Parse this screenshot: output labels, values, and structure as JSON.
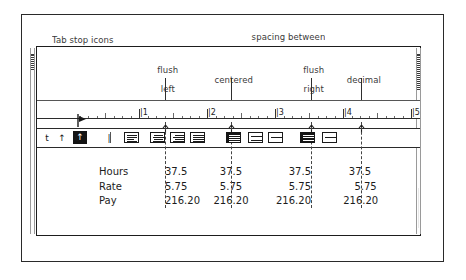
{
  "figure": {
    "callouts": {
      "tab_stop_icons": "Tab stop icons",
      "spacing_between_line1": "spacing between",
      "spacing_between_line2": "paragraph icons"
    },
    "tab_labels": [
      {
        "id": "flush-left",
        "line1": "flush",
        "line2": "left"
      },
      {
        "id": "centered",
        "line1": "",
        "line2": "centered"
      },
      {
        "id": "flush-right",
        "line1": "flush",
        "line2": "right"
      },
      {
        "id": "decimal",
        "line1": "",
        "line2": "decimal"
      }
    ]
  },
  "ruler": {
    "numbers": [
      "1",
      "2",
      "3",
      "4",
      "5"
    ],
    "tick_prefix": "|",
    "unit": "inches",
    "tab_markers": [
      {
        "type": "flush-left",
        "glyph": "t"
      },
      {
        "type": "centered",
        "glyph": "↑"
      },
      {
        "type": "flush-right",
        "glyph": "↑"
      },
      {
        "type": "decimal",
        "glyph": "↑"
      }
    ],
    "indent_marker": "first-line-indent"
  },
  "toolbar": {
    "tab_stop_buttons": [
      {
        "name": "tab-left",
        "glyph": "t",
        "selected": false
      },
      {
        "name": "tab-center",
        "glyph": "↑",
        "selected": false
      },
      {
        "name": "tab-right",
        "glyph": "ƨ",
        "selected": false
      },
      {
        "name": "tab-decimal",
        "glyph": "↑",
        "selected": true
      },
      {
        "name": "tab-bar",
        "glyph": "|",
        "selected": false
      }
    ],
    "alignment_buttons": [
      {
        "name": "align-left",
        "selected": true
      },
      {
        "name": "align-center",
        "selected": false
      },
      {
        "name": "align-right",
        "selected": false
      },
      {
        "name": "align-justify",
        "selected": false
      }
    ],
    "line_spacing_buttons": [
      {
        "name": "line-spacing-single",
        "selected": true
      },
      {
        "name": "line-spacing-one-half",
        "selected": false
      },
      {
        "name": "line-spacing-double",
        "selected": false
      }
    ],
    "paragraph_spacing_buttons": [
      {
        "name": "paragraph-spacing-closed",
        "selected": true
      },
      {
        "name": "paragraph-spacing-open",
        "selected": false
      }
    ]
  },
  "table": {
    "rows": [
      {
        "label": "Hours",
        "values": [
          "37.5",
          "37.5",
          "37.5",
          "37.5"
        ]
      },
      {
        "label": "Rate",
        "values": [
          "5.75",
          "5.75",
          "5.75",
          "5.75"
        ]
      },
      {
        "label": "Pay",
        "values": [
          "216.20",
          "216.20",
          "216.20",
          "216.20"
        ]
      }
    ],
    "column_alignment": [
      "flush-left",
      "centered",
      "flush-right",
      "decimal"
    ]
  },
  "colors": {
    "ink": "#1a1a1a",
    "frame": "#2a2a2a",
    "selected_fill": "#151515",
    "page": "#ffffff"
  }
}
